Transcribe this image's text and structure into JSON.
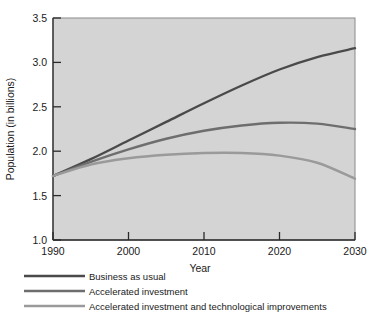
{
  "chart_data": {
    "type": "line",
    "title": "",
    "xlabel": "Year",
    "ylabel": "Population (in billions)",
    "xlim": [
      1990,
      2030
    ],
    "ylim": [
      1.0,
      3.5
    ],
    "xticks": [
      "1990",
      "2000",
      "2010",
      "2020",
      "2030"
    ],
    "yticks": [
      "1.0",
      "1.5",
      "2.0",
      "2.5",
      "3.0",
      "3.5"
    ],
    "grid": false,
    "legend_position": "below-plot-left",
    "plot_background": "#d4d4d4",
    "x": [
      1990,
      1995,
      2000,
      2005,
      2010,
      2015,
      2020,
      2025,
      2030
    ],
    "series": [
      {
        "name": "Business as usual",
        "color": "#4a4a4a",
        "values": [
          1.72,
          1.91,
          2.12,
          2.33,
          2.54,
          2.74,
          2.92,
          3.06,
          3.16
        ]
      },
      {
        "name": "Accelerated investment",
        "color": "#6e6e6e",
        "values": [
          1.72,
          1.88,
          2.02,
          2.14,
          2.23,
          2.29,
          2.32,
          2.31,
          2.25
        ]
      },
      {
        "name": "Accelerated investment and technological improvements",
        "color": "#9a9a9a",
        "values": [
          1.72,
          1.85,
          1.92,
          1.96,
          1.98,
          1.98,
          1.95,
          1.87,
          1.69
        ]
      }
    ]
  },
  "legend": {
    "items": [
      {
        "label": "Business as usual",
        "color": "#4a4a4a"
      },
      {
        "label": "Accelerated investment",
        "color": "#6e6e6e"
      },
      {
        "label": "Accelerated investment and technological improvements",
        "color": "#9a9a9a"
      }
    ]
  }
}
